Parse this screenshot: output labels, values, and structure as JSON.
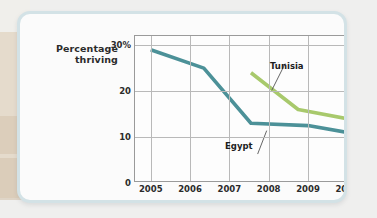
{
  "chart_data": {
    "type": "line",
    "title": "",
    "xlabel": "Year",
    "ylabel": "Percentage thriving",
    "xlim": [
      2004.6,
      2010.4
    ],
    "ylim": [
      0,
      32
    ],
    "grid": true,
    "legend_position": "inline-annotations",
    "yticks": [
      {
        "value": 0,
        "label": "0"
      },
      {
        "value": 10,
        "label": "10"
      },
      {
        "value": 20,
        "label": "20"
      },
      {
        "value": 30,
        "label": "30%"
      }
    ],
    "xticks": [
      {
        "value": 2005,
        "label": "2005"
      },
      {
        "value": 2006,
        "label": "2006"
      },
      {
        "value": 2007,
        "label": "2007"
      },
      {
        "value": 2008,
        "label": "2008"
      },
      {
        "value": 2009,
        "label": "2009"
      },
      {
        "value": 2010,
        "label": "2010"
      }
    ],
    "series": [
      {
        "name": "Egypt",
        "color": "#4c9198",
        "x": [
          2005,
          2006.35,
          2007.55,
          2009.0,
          2010
        ],
        "values": [
          29,
          25,
          13,
          12.5,
          11
        ]
      },
      {
        "name": "Tunisia",
        "color": "#a8c96c",
        "x": [
          2007.55,
          2008.75,
          2010
        ],
        "values": [
          24,
          16,
          14
        ]
      }
    ],
    "annotations": [
      {
        "text": "Tunisia",
        "series": "Tunisia"
      },
      {
        "text": "Egypt",
        "series": "Egypt"
      }
    ]
  }
}
